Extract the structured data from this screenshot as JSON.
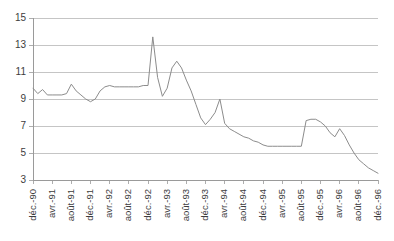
{
  "chart_data": {
    "type": "line",
    "title": "",
    "subtitle": "",
    "xlabel": "",
    "ylabel": "",
    "ylim": [
      3,
      15
    ],
    "yticks": [
      3,
      5,
      7,
      9,
      11,
      13,
      15
    ],
    "ytick_labels": [
      "3",
      "5",
      "7",
      "9",
      "11",
      "13",
      "15"
    ],
    "grid": true,
    "legend": false,
    "legend_position": "none",
    "line_color": "#8c8c8c",
    "grid_color": "#b6b6b6",
    "axis_color": "#9a9a9a",
    "text_color": "#3d3d3d",
    "xtick_labels": [
      "déc.-90",
      "avr.-91",
      "août-91",
      "déc.-91",
      "avr.-92",
      "août-92",
      "déc.-92",
      "avr.-93",
      "août-93",
      "déc.-93",
      "avr.-94",
      "août-94",
      "déc.-94",
      "avr.-95",
      "août-95",
      "déc.-95",
      "avr.-96",
      "août-96",
      "déc.-96"
    ],
    "xtick_step_months": 4,
    "x": [
      "déc.-90",
      "janv.-91",
      "févr.-91",
      "mars-91",
      "avr.-91",
      "mai-91",
      "juin-91",
      "juil.-91",
      "août-91",
      "sept.-91",
      "oct.-91",
      "nov.-91",
      "déc.-91",
      "janv.-92",
      "févr.-92",
      "mars-92",
      "avr.-92",
      "mai-92",
      "juin-92",
      "juil.-92",
      "août-92",
      "sept.-92",
      "oct.-92",
      "nov.-92",
      "déc.-92",
      "janv.-93",
      "févr.-93",
      "mars-93",
      "avr.-93",
      "mai-93",
      "juin-93",
      "juil.-93",
      "août-93",
      "sept.-93",
      "oct.-93",
      "nov.-93",
      "déc.-93",
      "janv.-94",
      "févr.-94",
      "mars-94",
      "avr.-94",
      "mai-94",
      "juin-94",
      "juil.-94",
      "août-94",
      "sept.-94",
      "oct.-94",
      "nov.-94",
      "déc.-94",
      "janv.-95",
      "févr.-95",
      "mars-95",
      "avr.-95",
      "mai-95",
      "juin-95",
      "juil.-95",
      "août-95",
      "sept.-95",
      "oct.-95",
      "nov.-95",
      "déc.-95",
      "janv.-96",
      "févr.-96",
      "mars-96",
      "avr.-96",
      "mai-96",
      "juin-96",
      "juil.-96",
      "août-96",
      "sept.-96",
      "oct.-96",
      "nov.-96",
      "déc.-96"
    ],
    "values": [
      9.8,
      9.4,
      9.7,
      9.3,
      9.3,
      9.3,
      9.3,
      9.4,
      10.1,
      9.6,
      9.3,
      9.0,
      8.8,
      9.0,
      9.6,
      9.9,
      10.0,
      9.9,
      9.9,
      9.9,
      9.9,
      9.9,
      9.9,
      10.0,
      10.0,
      13.6,
      10.6,
      9.2,
      9.8,
      11.3,
      11.8,
      11.3,
      10.4,
      9.6,
      8.6,
      7.6,
      7.1,
      7.5,
      8.0,
      9.0,
      7.2,
      6.8,
      6.6,
      6.4,
      6.2,
      6.1,
      5.9,
      5.8,
      5.6,
      5.5,
      5.5,
      5.5,
      5.5,
      5.5,
      5.5,
      5.5,
      5.5,
      7.4,
      7.5,
      7.5,
      7.3,
      7.0,
      6.5,
      6.2,
      6.8,
      6.3,
      5.6,
      5.0,
      4.5,
      4.2,
      3.9,
      3.7,
      3.5
    ]
  }
}
